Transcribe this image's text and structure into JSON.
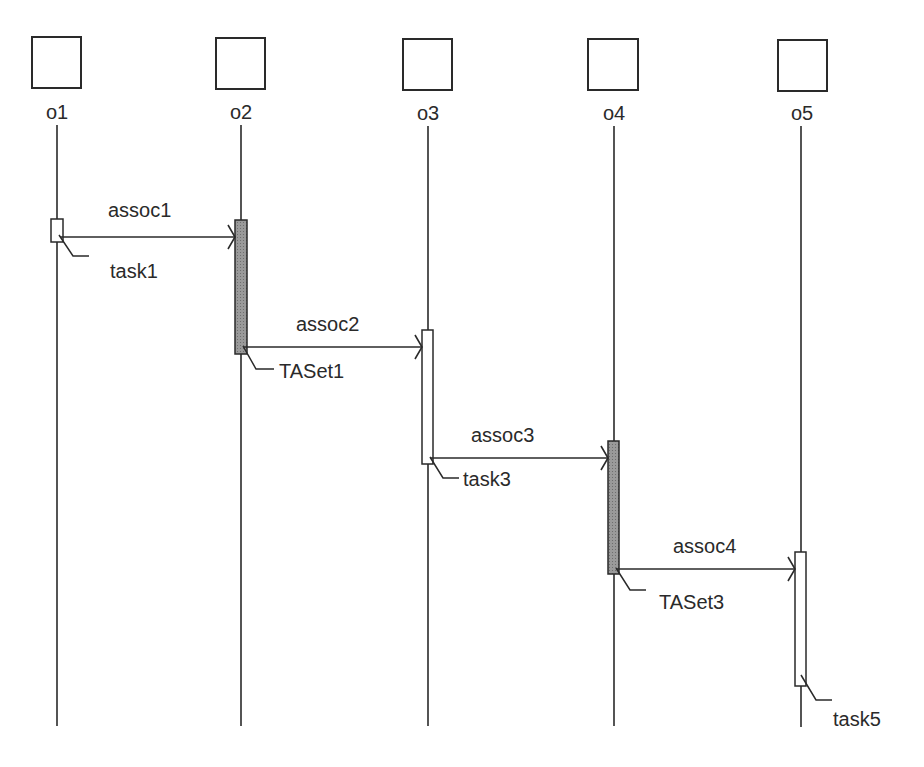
{
  "diagram": {
    "type": "sequence-diagram",
    "colors": {
      "line": "#2a2a2a",
      "activation_filled": "#8c8c8c",
      "activation_empty": "#ffffff",
      "background": "#ffffff"
    },
    "objects": [
      {
        "id": "o1",
        "label": "o1"
      },
      {
        "id": "o2",
        "label": "o2"
      },
      {
        "id": "o3",
        "label": "o3"
      },
      {
        "id": "o4",
        "label": "o4"
      },
      {
        "id": "o5",
        "label": "o5"
      }
    ],
    "messages": [
      {
        "label": "assoc1",
        "from": "o1",
        "to": "o2"
      },
      {
        "label": "assoc2",
        "from": "o2",
        "to": "o3"
      },
      {
        "label": "assoc3",
        "from": "o3",
        "to": "o4"
      },
      {
        "label": "assoc4",
        "from": "o4",
        "to": "o5"
      }
    ],
    "activations": [
      {
        "object": "o1",
        "label": "task1",
        "filled": false
      },
      {
        "object": "o2",
        "label": "TASet1",
        "filled": true
      },
      {
        "object": "o3",
        "label": "task3",
        "filled": false
      },
      {
        "object": "o4",
        "label": "TASet3",
        "filled": true
      },
      {
        "object": "o5",
        "label": "task5",
        "filled": false
      }
    ]
  }
}
